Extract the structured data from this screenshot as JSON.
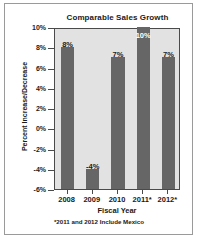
{
  "chart_data": {
    "type": "bar",
    "title": "Comparable Sales Growth",
    "xlabel": "Fiscal Year",
    "ylabel": "Percent Increase/Decrease",
    "categories": [
      "2008",
      "2009",
      "2010",
      "2011*",
      "2012*"
    ],
    "values": [
      8,
      -4,
      7,
      10,
      7
    ],
    "value_labels": [
      "8%",
      "-4%",
      "7%",
      "10%",
      "7%"
    ],
    "label_placement": [
      "above",
      "above",
      "above",
      "inside",
      "above"
    ],
    "ylim": [
      -6,
      10
    ],
    "ytick_values": [
      10,
      8,
      6,
      4,
      2,
      0,
      -2,
      -4,
      -6
    ],
    "ytick_labels": [
      "10%",
      "8%",
      "6%",
      "4%",
      "2%",
      "0%",
      "-2%",
      "-4%",
      "-6%"
    ],
    "grid": false,
    "legend": "none",
    "baseline": -6,
    "footnote": "*2011 and 2012 Include Mexico",
    "colors": {
      "bar": "#666666",
      "plot_background": "#e2e2e2",
      "axis": "#4a4a4a",
      "text": "#1a1a1a",
      "inside_label": "#ffffff",
      "page_background": "#ffffff",
      "page_border": "#9a9a9a"
    }
  }
}
